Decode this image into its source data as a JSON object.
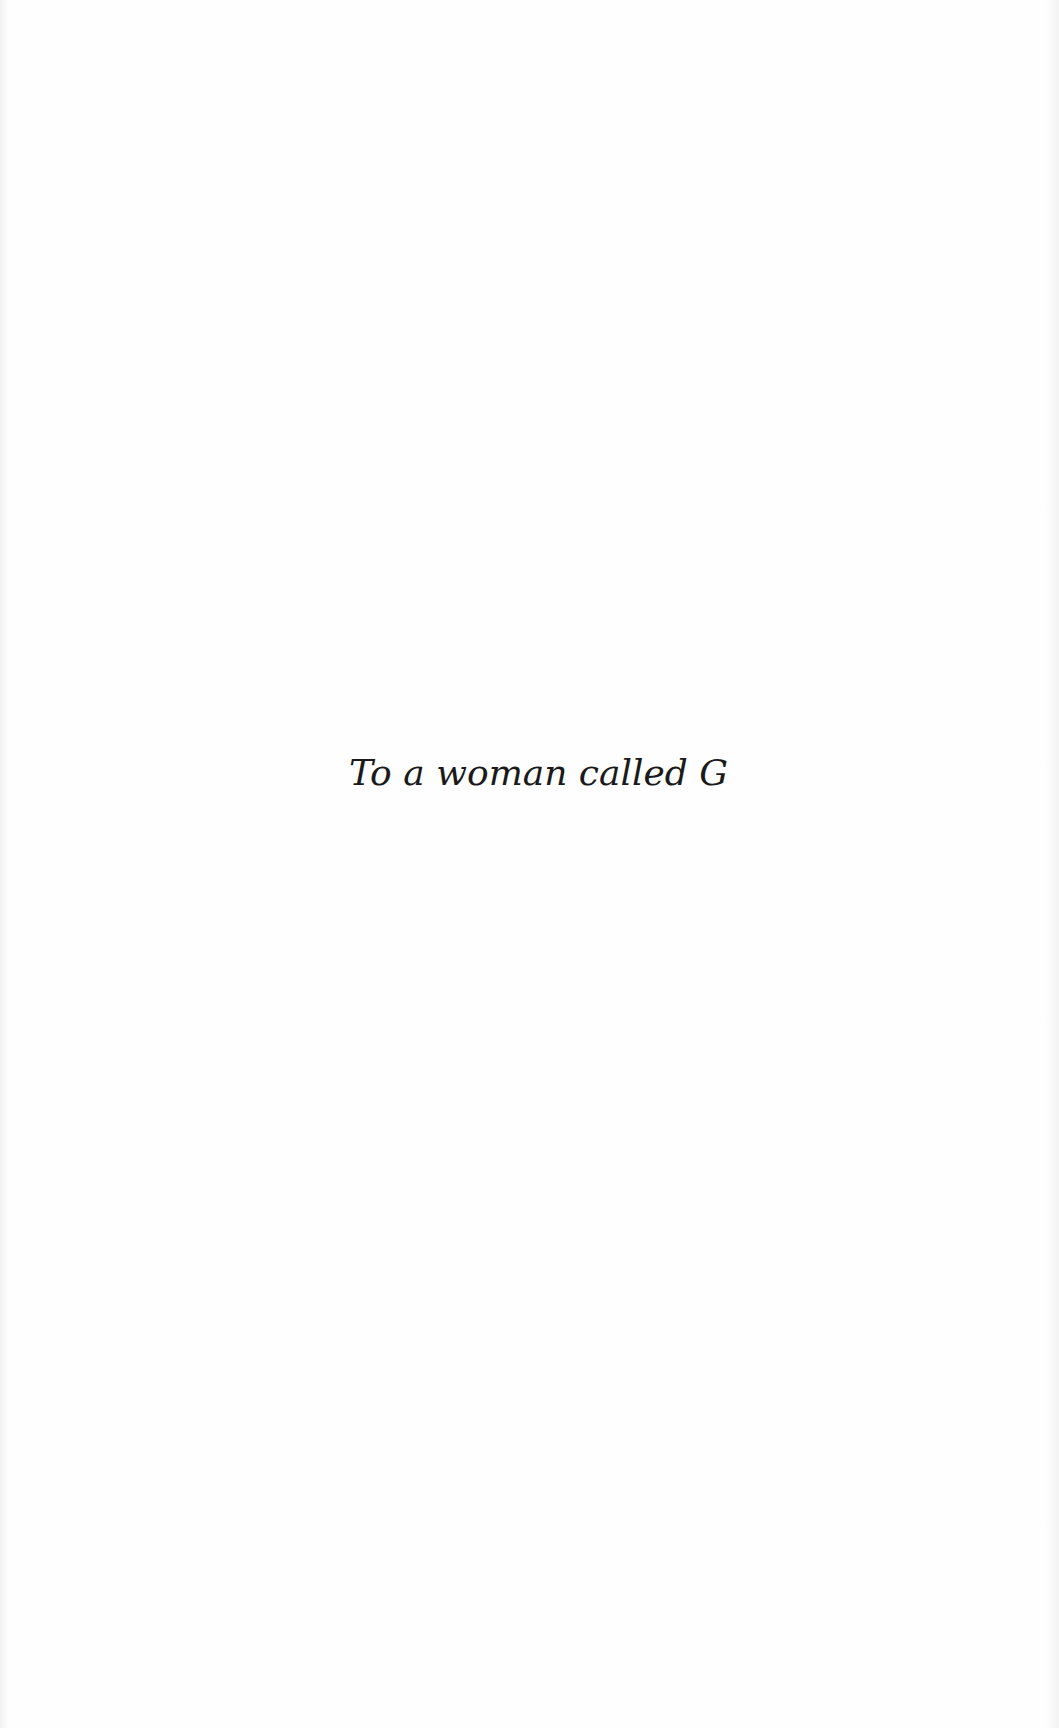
{
  "page": {
    "type": "dedication",
    "dedication_text": "To a woman called G"
  }
}
